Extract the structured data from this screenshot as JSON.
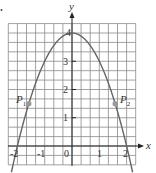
{
  "chart_data": {
    "type": "line",
    "title": "",
    "xlabel": "x",
    "ylabel": "y",
    "xlim": [
      -2.3333,
      2.3333
    ],
    "ylim": [
      -0.6667,
      4.3333
    ],
    "grid": true,
    "grid_step": 0.3333,
    "x_ticks": [
      {
        "value": -2,
        "label": "-2"
      },
      {
        "value": -1,
        "label": "-1"
      },
      {
        "value": 0,
        "label": "0"
      },
      {
        "value": 1,
        "label": "1"
      },
      {
        "value": 2,
        "label": "2"
      }
    ],
    "y_ticks": [
      {
        "value": 1,
        "label": "1"
      },
      {
        "value": 2,
        "label": "2"
      },
      {
        "value": 3,
        "label": "3"
      },
      {
        "value": 4,
        "label": "4"
      }
    ],
    "series": [
      {
        "name": "y = 4 - x^2",
        "x": [
          -2.2,
          -2.0,
          -1.5,
          -1.0,
          -0.5,
          0.0,
          0.5,
          1.0,
          1.5,
          2.0,
          2.2
        ],
        "y": [
          -0.84,
          0.0,
          1.75,
          3.0,
          3.75,
          4.0,
          3.75,
          3.0,
          1.75,
          0.0,
          -0.84
        ]
      }
    ],
    "points": [
      {
        "label": "P",
        "subscript": "1",
        "x": -1.58,
        "y": 1.5
      },
      {
        "label": "P",
        "subscript": "2",
        "x": 1.58,
        "y": 1.5
      }
    ]
  },
  "labels": {
    "x_axis": "x",
    "y_axis": "y",
    "p1": "P",
    "p1_sub": "1",
    "p2": "P",
    "p2_sub": "2",
    "tick_x_m2": "-2",
    "tick_x_m1": "-1",
    "tick_x_0": "0",
    "tick_x_1": "1",
    "tick_x_2": "2",
    "tick_y_1": "1",
    "tick_y_2": "2",
    "tick_y_3": "3",
    "tick_y_4": "4"
  }
}
